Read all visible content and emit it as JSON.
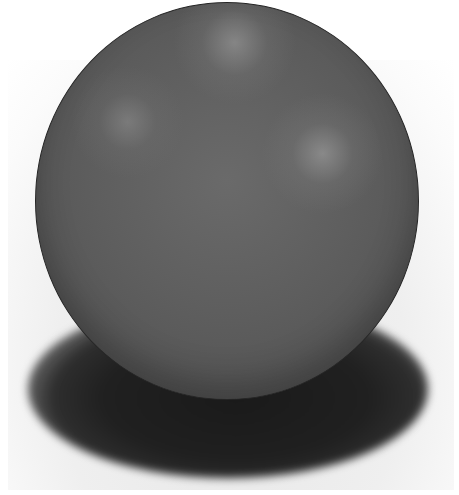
{
  "scene": {
    "subject": "gray sphere",
    "background_color": "#ffffff",
    "floor_color": "#eeeeee",
    "sphere_color": "#5e5e5e",
    "sphere_edge_color": "#262626",
    "shadow_color": "#1a1a1a",
    "highlights": 3
  }
}
